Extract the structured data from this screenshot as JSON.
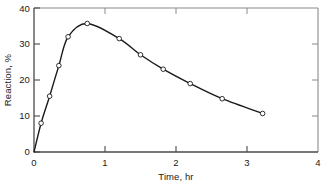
{
  "chart_data": {
    "type": "line",
    "title": "",
    "xlabel": "Time, hr",
    "ylabel": "Reaction, %",
    "xlim": [
      0,
      4
    ],
    "ylim": [
      0,
      40
    ],
    "xticks": [
      0,
      1,
      2,
      3,
      4
    ],
    "yticks": [
      0,
      10,
      20,
      30,
      40
    ],
    "xtick_labels": [
      "0",
      "1",
      "2",
      "3",
      "4"
    ],
    "ytick_labels": [
      "0",
      "10",
      "20",
      "30",
      "40"
    ],
    "grid": false,
    "legend": null,
    "marker": "open-circle",
    "line_color": "#1a1a1a",
    "x": [
      0,
      0.1,
      0.22,
      0.35,
      0.48,
      0.75,
      1.2,
      1.5,
      1.82,
      2.2,
      2.65,
      3.22
    ],
    "y": [
      0,
      8,
      15.5,
      24,
      32,
      35.7,
      31.5,
      27,
      23,
      19,
      14.8,
      10.7
    ],
    "series": [
      {
        "name": "Reaction",
        "points": [
          {
            "x": 0,
            "y": 0
          },
          {
            "x": 0.1,
            "y": 8
          },
          {
            "x": 0.22,
            "y": 15.5
          },
          {
            "x": 0.35,
            "y": 24
          },
          {
            "x": 0.48,
            "y": 32
          },
          {
            "x": 0.75,
            "y": 35.7
          },
          {
            "x": 1.2,
            "y": 31.5
          },
          {
            "x": 1.5,
            "y": 27
          },
          {
            "x": 1.82,
            "y": 23
          },
          {
            "x": 2.2,
            "y": 19
          },
          {
            "x": 2.65,
            "y": 14.8
          },
          {
            "x": 3.22,
            "y": 10.7
          }
        ]
      }
    ]
  },
  "axes": {
    "x_title": "Time, hr",
    "y_title": "Reaction, %",
    "x_ticks": [
      {
        "value": 0,
        "label": "0"
      },
      {
        "value": 1,
        "label": "1"
      },
      {
        "value": 2,
        "label": "2"
      },
      {
        "value": 3,
        "label": "3"
      },
      {
        "value": 4,
        "label": "4"
      }
    ],
    "y_ticks": [
      {
        "value": 0,
        "label": "0"
      },
      {
        "value": 10,
        "label": "10"
      },
      {
        "value": 20,
        "label": "20"
      },
      {
        "value": 30,
        "label": "30"
      },
      {
        "value": 40,
        "label": "40"
      }
    ]
  },
  "colors": {
    "line": "#1a1a1a",
    "axis": "#555555",
    "frame": "#8a8a8a",
    "marker_fill": "#ffffff",
    "background": "#ffffff"
  }
}
